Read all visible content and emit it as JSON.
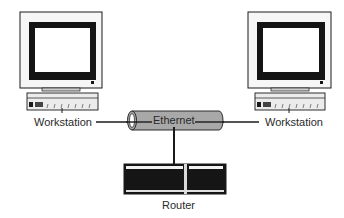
{
  "diagram": {
    "nodes": {
      "workstation_left": {
        "label": "Workstation"
      },
      "workstation_right": {
        "label": "Workstation"
      },
      "ethernet": {
        "label": "Ethernet"
      },
      "router": {
        "label": "Router"
      }
    },
    "edges": [
      {
        "from": "workstation_left",
        "to": "ethernet"
      },
      {
        "from": "workstation_right",
        "to": "ethernet"
      },
      {
        "from": "ethernet",
        "to": "router"
      }
    ],
    "colors": {
      "line": "#1a1a1a",
      "cylinder_fill": "#a8a8a8",
      "device_dark": "#151515",
      "device_light": "#f4f4f4"
    }
  }
}
